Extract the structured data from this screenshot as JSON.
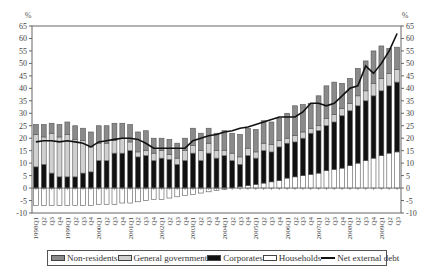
{
  "chart_data": {
    "type": "bar",
    "subtype": "stacked bar with line overlay",
    "title": "",
    "ylabel_left": "%",
    "ylabel_right": "%",
    "ylim": [
      -10,
      65
    ],
    "yticks": [
      -10,
      -5,
      0,
      5,
      10,
      15,
      20,
      25,
      30,
      35,
      40,
      45,
      50,
      55,
      60,
      65
    ],
    "grid": false,
    "legend_position": "bottom",
    "categories": [
      "1998Q1",
      "Q2",
      "Q3",
      "Q4",
      "1999Q1",
      "Q2",
      "Q3",
      "Q4",
      "2000Q1",
      "Q2",
      "Q3",
      "Q4",
      "2001Q1",
      "Q2",
      "Q3",
      "Q4",
      "2002Q1",
      "Q2",
      "Q3",
      "Q4",
      "2003Q1",
      "Q2",
      "Q3",
      "Q4",
      "2004Q1",
      "Q2",
      "Q3",
      "Q4",
      "2005Q1",
      "Q2",
      "Q3",
      "Q4",
      "2006Q1",
      "Q2",
      "Q3",
      "Q4",
      "2007Q1",
      "Q2",
      "Q3",
      "Q4",
      "2008Q1",
      "Q2",
      "Q3",
      "Q4",
      "2009Q1",
      "Q2",
      "Q3"
    ],
    "series": [
      {
        "name": "Households",
        "color": "#ffffff",
        "values": [
          -7,
          -7,
          -7,
          -7,
          -7,
          -7,
          -7,
          -7,
          -6.5,
          -6.5,
          -6.5,
          -6,
          -6,
          -5.5,
          -5,
          -4.5,
          -4.5,
          -4,
          -3.5,
          -3,
          -2.5,
          -2,
          -1.5,
          -1,
          -0.5,
          0,
          0.5,
          1,
          1.5,
          2,
          2.5,
          3,
          4,
          4.5,
          5,
          5.5,
          6,
          7,
          7.5,
          8,
          9,
          10,
          11,
          12,
          13,
          14,
          14.5
        ]
      },
      {
        "name": "Corporates",
        "color": "#111111",
        "values": [
          8.5,
          9.5,
          6,
          4.5,
          4.5,
          4.5,
          6,
          6.5,
          11,
          11,
          14,
          14,
          15,
          12.5,
          13,
          11,
          12,
          11.5,
          9.5,
          11,
          14,
          11,
          14,
          12,
          13,
          11,
          9,
          12,
          10.5,
          13,
          12,
          13.5,
          14,
          14,
          15,
          16.5,
          17,
          18,
          19,
          21,
          22,
          23,
          24,
          25,
          26,
          27,
          28
        ]
      },
      {
        "name": "General government",
        "color": "#d0d0d0",
        "values": [
          13,
          11,
          16,
          16,
          17,
          15,
          13,
          10,
          7,
          7,
          5,
          6,
          3.5,
          2,
          2,
          3,
          3,
          2,
          2.5,
          4,
          3,
          4,
          4,
          3,
          2,
          3,
          3,
          3,
          2.5,
          3,
          3,
          2.5,
          2,
          2.5,
          2.5,
          2,
          2,
          3,
          3,
          3,
          3,
          4,
          4,
          5,
          5,
          5,
          5
        ]
      },
      {
        "name": "Non-residents",
        "color": "#8a8a8a",
        "values": [
          4,
          5,
          4,
          5,
          5,
          5.5,
          5,
          6,
          7,
          7,
          7,
          6,
          7,
          8,
          8,
          6,
          5,
          6,
          6,
          5,
          7,
          7,
          6,
          7,
          8,
          8,
          9,
          8,
          9,
          9,
          9,
          9,
          10,
          12,
          11,
          10,
          12,
          13,
          13,
          10,
          10,
          11,
          12,
          13,
          13,
          10,
          9
        ]
      },
      {
        "name": "Net external debt",
        "type": "line",
        "color": "#111111",
        "values": [
          18.5,
          19,
          19,
          18.5,
          19,
          18.5,
          18,
          16.5,
          18.5,
          19,
          19.5,
          20,
          20,
          19.5,
          18,
          16,
          16,
          16,
          16,
          16,
          19,
          20,
          21,
          21.5,
          22.5,
          23,
          24,
          24.5,
          25.5,
          26.5,
          27.5,
          28.5,
          28.5,
          28.5,
          30.5,
          34,
          34,
          33,
          34,
          37,
          40,
          41,
          49,
          46,
          50,
          55,
          62
        ]
      }
    ]
  },
  "axis": {
    "left_unit": "%",
    "right_unit": "%",
    "ticks": [
      "65",
      "60",
      "55",
      "50",
      "45",
      "40",
      "35",
      "30",
      "25",
      "20",
      "15",
      "10",
      "5",
      "0",
      "-5",
      "-10"
    ],
    "year_labels": [
      {
        "index": 0,
        "label": "1998Q1"
      },
      {
        "index": 4,
        "label": "1999Q1"
      },
      {
        "index": 8,
        "label": "2000Q1"
      },
      {
        "index": 12,
        "label": "2001Q1"
      },
      {
        "index": 16,
        "label": "2002Q1"
      },
      {
        "index": 20,
        "label": "2003Q1"
      },
      {
        "index": 24,
        "label": "2004Q1"
      },
      {
        "index": 28,
        "label": "2005Q1"
      },
      {
        "index": 32,
        "label": "2006Q1"
      },
      {
        "index": 36,
        "label": "2007Q1"
      },
      {
        "index": 40,
        "label": "2008Q1"
      },
      {
        "index": 44,
        "label": "2009Q1"
      }
    ]
  },
  "legend": {
    "items": [
      {
        "label": "Non-residents",
        "swatch": "#8a8a8a"
      },
      {
        "label": "General government",
        "swatch": "#d0d0d0"
      },
      {
        "label": "Corporates",
        "swatch": "#111111"
      },
      {
        "label": "Households",
        "swatch": "#ffffff"
      },
      {
        "label": "Net external debt",
        "swatch": "line"
      }
    ]
  }
}
